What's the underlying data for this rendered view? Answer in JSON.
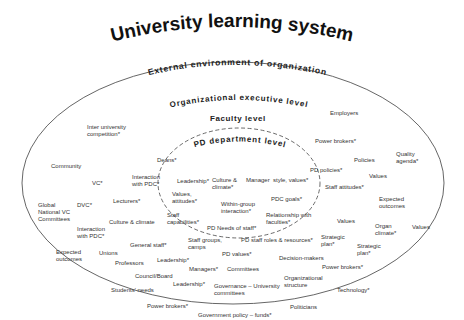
{
  "title": "University learning system",
  "levels": {
    "external": "External environment of organization",
    "executive": "Organizational executive level",
    "faculty": "Faculty level",
    "pd_department": "PD department level"
  },
  "colors": {
    "outer_ellipse": "#555555",
    "inner_dashed_ellipse": "#444444",
    "text": "#333333"
  },
  "labels": [
    {
      "text": "Inter university\ncompetition*",
      "x": 87,
      "y": 66
    },
    {
      "text": "Employers",
      "x": 330,
      "y": 52
    },
    {
      "text": "Power brokers*",
      "x": 315,
      "y": 80
    },
    {
      "text": "Community",
      "x": 51,
      "y": 105
    },
    {
      "text": "Deans*",
      "x": 157,
      "y": 99
    },
    {
      "text": "Policies",
      "x": 354,
      "y": 99
    },
    {
      "text": "Quality\nagenda*",
      "x": 396,
      "y": 93
    },
    {
      "text": "PD policies*",
      "x": 310,
      "y": 109
    },
    {
      "text": "VC*",
      "x": 92,
      "y": 122
    },
    {
      "text": "Interaction\nwith PDC*",
      "x": 132,
      "y": 116
    },
    {
      "text": "Values",
      "x": 369,
      "y": 115
    },
    {
      "text": "Staff attitudes*",
      "x": 325,
      "y": 126
    },
    {
      "text": "Global\nNational VC\nCommittees",
      "x": 38,
      "y": 144
    },
    {
      "text": "DVC*",
      "x": 77,
      "y": 144
    },
    {
      "text": "Lecturers*",
      "x": 113,
      "y": 140
    },
    {
      "text": "Expected\noutcomes",
      "x": 379,
      "y": 138
    },
    {
      "text": "Culture & climate",
      "x": 109,
      "y": 161
    },
    {
      "text": "Values",
      "x": 337,
      "y": 160
    },
    {
      "text": "Organ\nclimate*",
      "x": 375,
      "y": 165
    },
    {
      "text": "Values",
      "x": 412,
      "y": 166
    },
    {
      "text": "Interaction\nwith PDC*",
      "x": 77,
      "y": 168
    },
    {
      "text": "Strategic\nplan*",
      "x": 321,
      "y": 176
    },
    {
      "text": "Strategic\nplan*",
      "x": 357,
      "y": 185
    },
    {
      "text": "General staff*",
      "x": 130,
      "y": 184
    },
    {
      "text": "Expected\noutcomes",
      "x": 56,
      "y": 191
    },
    {
      "text": "Unions",
      "x": 99,
      "y": 192
    },
    {
      "text": "Professors",
      "x": 115,
      "y": 202
    },
    {
      "text": "Leadership*",
      "x": 157,
      "y": 199
    },
    {
      "text": "Decision-makers",
      "x": 279,
      "y": 197
    },
    {
      "text": "Power brokers*",
      "x": 322,
      "y": 206
    },
    {
      "text": "Managers*",
      "x": 189,
      "y": 208
    },
    {
      "text": "Committees",
      "x": 227,
      "y": 208
    },
    {
      "text": "Council/Board",
      "x": 135,
      "y": 215
    },
    {
      "text": "Organizational\nstructure",
      "x": 284,
      "y": 217
    },
    {
      "text": "Leadership*",
      "x": 173,
      "y": 223
    },
    {
      "text": "Governance – University\ncommittees",
      "x": 214,
      "y": 225
    },
    {
      "text": "Students' needs",
      "x": 111,
      "y": 229
    },
    {
      "text": "Technology*",
      "x": 337,
      "y": 229
    },
    {
      "text": "Power brokers*",
      "x": 147,
      "y": 245
    },
    {
      "text": "Politicians",
      "x": 290,
      "y": 246
    },
    {
      "text": "Government policy – funds*",
      "x": 198,
      "y": 254
    }
  ],
  "pd_labels": [
    {
      "text": "Leadership*",
      "x": 177,
      "y": 120
    },
    {
      "text": "Culture &\nclimate*",
      "x": 212,
      "y": 119
    },
    {
      "text": "Manager  style, values*",
      "x": 246,
      "y": 119
    },
    {
      "text": "Values,\nattitudes*",
      "x": 172,
      "y": 133
    },
    {
      "text": "PDC goals*",
      "x": 271,
      "y": 138
    },
    {
      "text": "Within-group\ninteraction*",
      "x": 221,
      "y": 143
    },
    {
      "text": "Staff\ncapabilities*",
      "x": 167,
      "y": 154
    },
    {
      "text": "Relationship with\nfaculties*",
      "x": 266,
      "y": 154
    },
    {
      "text": "PD Needs of staff*",
      "x": 207,
      "y": 167
    },
    {
      "text": "Staff groups,\ncamps",
      "x": 188,
      "y": 179
    },
    {
      "text": "PD staff roles & resources*",
      "x": 241,
      "y": 179
    },
    {
      "text": "PD values*",
      "x": 222,
      "y": 193
    }
  ]
}
